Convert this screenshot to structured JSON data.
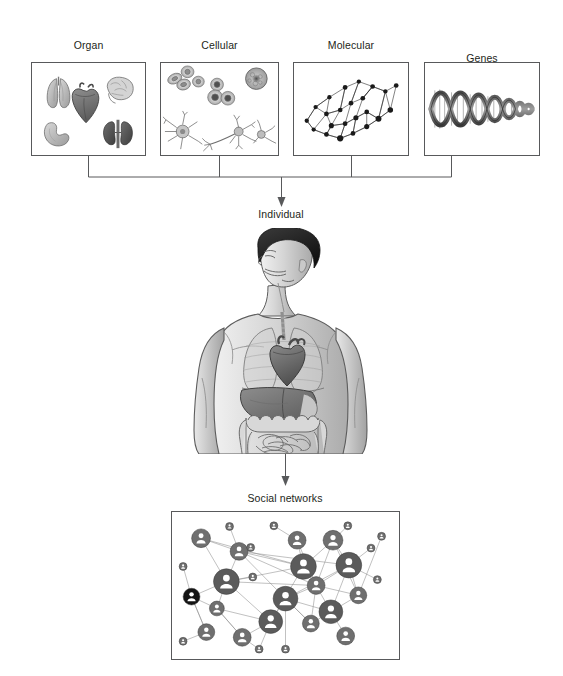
{
  "figure": {
    "width": 563,
    "height": 676,
    "background": "#ffffff",
    "line_color": "#58595b",
    "text_color": "#231f20"
  },
  "panels": [
    {
      "id": "organ-networks",
      "label": "Organ\nnetworks",
      "label_line1": "Organ",
      "label_line2": "networks",
      "icon": "organs-illustration",
      "contents": [
        "lungs",
        "heart",
        "brain",
        "stomach",
        "kidneys"
      ],
      "x": 31,
      "y": 62,
      "w": 115,
      "h": 94
    },
    {
      "id": "cellular-networks",
      "label": "Cellular\nnetworks",
      "label_line1": "Cellular",
      "label_line2": "networks",
      "icon": "cells-illustration",
      "contents": [
        "red blood cells",
        "macrophage",
        "leukocytes",
        "astrocyte",
        "neurons"
      ],
      "x": 160,
      "y": 62,
      "w": 119,
      "h": 94
    },
    {
      "id": "molecular-networks",
      "label": "Molecular\nnetworks",
      "label_line1": "Molecular",
      "label_line2": "networks",
      "icon": "node-link-graph",
      "contents": [
        "interaction network graph"
      ],
      "x": 293,
      "y": 62,
      "w": 116,
      "h": 94
    },
    {
      "id": "genes",
      "label": "Genes",
      "label_line1": "",
      "label_line2": "Genes",
      "icon": "dna-helix",
      "contents": [
        "DNA double helix"
      ],
      "x": 424,
      "y": 62,
      "w": 116,
      "h": 94
    }
  ],
  "stages": {
    "individual": {
      "label": "Individual",
      "icon": "human-torso-anatomy",
      "contents": [
        "head",
        "lungs",
        "heart",
        "liver",
        "stomach",
        "intestines"
      ]
    },
    "social": {
      "label": "Social networks",
      "icon": "social-graph"
    }
  },
  "connectors": {
    "bracket": "four-panel-merge-bracket",
    "arrow_to_individual": "down-arrow",
    "arrow_to_social": "down-arrow"
  },
  "chart_data": {
    "type": "scatter",
    "title": "Social networks",
    "xlabel": "",
    "ylabel": "",
    "node_count": 30,
    "edge_count": 52,
    "nodes": [
      {
        "id": 1,
        "x": 0.1,
        "y": 0.14,
        "r": 9.5,
        "style": "mid"
      },
      {
        "id": 2,
        "x": 0.28,
        "y": 0.24,
        "r": 9.0,
        "style": "mid"
      },
      {
        "id": 3,
        "x": 0.22,
        "y": 0.47,
        "r": 13.0,
        "style": "dark"
      },
      {
        "id": 4,
        "x": 0.055,
        "y": 0.585,
        "r": 8.5,
        "style": "black"
      },
      {
        "id": 5,
        "x": 0.175,
        "y": 0.675,
        "r": 7.5,
        "style": "mid"
      },
      {
        "id": 6,
        "x": 0.125,
        "y": 0.855,
        "r": 8.5,
        "style": "mid"
      },
      {
        "id": 7,
        "x": 0.43,
        "y": 0.775,
        "r": 12.0,
        "style": "dark"
      },
      {
        "id": 8,
        "x": 0.5,
        "y": 0.6,
        "r": 12.5,
        "style": "dark"
      },
      {
        "id": 9,
        "x": 0.645,
        "y": 0.5,
        "r": 9.0,
        "style": "mid"
      },
      {
        "id": 10,
        "x": 0.585,
        "y": 0.355,
        "r": 13.0,
        "style": "dark"
      },
      {
        "id": 11,
        "x": 0.555,
        "y": 0.155,
        "r": 9.0,
        "style": "mid"
      },
      {
        "id": 12,
        "x": 0.725,
        "y": 0.155,
        "r": 10.0,
        "style": "mid"
      },
      {
        "id": 13,
        "x": 0.8,
        "y": 0.345,
        "r": 13.0,
        "style": "dark"
      },
      {
        "id": 14,
        "x": 0.845,
        "y": 0.575,
        "r": 8.5,
        "style": "mid"
      },
      {
        "id": 15,
        "x": 0.715,
        "y": 0.7,
        "r": 12.0,
        "style": "dark"
      },
      {
        "id": 16,
        "x": 0.62,
        "y": 0.79,
        "r": 8.5,
        "style": "mid"
      },
      {
        "id": 17,
        "x": 0.785,
        "y": 0.885,
        "r": 9.0,
        "style": "mid"
      },
      {
        "id": 18,
        "x": 0.295,
        "y": 0.895,
        "r": 9.0,
        "style": "mid"
      },
      {
        "id": 19,
        "x": 0.235,
        "y": 0.05,
        "r": 4.0,
        "style": "small"
      },
      {
        "id": 20,
        "x": 0.445,
        "y": 0.045,
        "r": 4.0,
        "style": "small"
      },
      {
        "id": 21,
        "x": 0.795,
        "y": 0.045,
        "r": 4.0,
        "style": "small"
      },
      {
        "id": 22,
        "x": 0.015,
        "y": 0.355,
        "r": 4.0,
        "style": "small"
      },
      {
        "id": 23,
        "x": 0.345,
        "y": 0.435,
        "r": 4.0,
        "style": "small"
      },
      {
        "id": 24,
        "x": 0.015,
        "y": 0.925,
        "r": 4.0,
        "style": "small"
      },
      {
        "id": 25,
        "x": 0.375,
        "y": 0.985,
        "r": 4.0,
        "style": "small"
      },
      {
        "id": 26,
        "x": 0.5,
        "y": 0.985,
        "r": 4.0,
        "style": "small"
      },
      {
        "id": 27,
        "x": 0.935,
        "y": 0.455,
        "r": 4.0,
        "style": "small"
      },
      {
        "id": 28,
        "x": 0.905,
        "y": 0.215,
        "r": 4.0,
        "style": "small"
      },
      {
        "id": 29,
        "x": 0.955,
        "y": 0.125,
        "r": 4.0,
        "style": "small"
      },
      {
        "id": 30,
        "x": 0.335,
        "y": 0.21,
        "r": 4.0,
        "style": "small"
      }
    ],
    "edges": [
      [
        1,
        2
      ],
      [
        1,
        3
      ],
      [
        1,
        10
      ],
      [
        2,
        19
      ],
      [
        2,
        3
      ],
      [
        2,
        8
      ],
      [
        2,
        13
      ],
      [
        2,
        9
      ],
      [
        3,
        4
      ],
      [
        3,
        5
      ],
      [
        3,
        7
      ],
      [
        3,
        9
      ],
      [
        3,
        10
      ],
      [
        3,
        23
      ],
      [
        4,
        22
      ],
      [
        4,
        6
      ],
      [
        4,
        5
      ],
      [
        5,
        7
      ],
      [
        5,
        18
      ],
      [
        6,
        4
      ],
      [
        7,
        8
      ],
      [
        7,
        18
      ],
      [
        7,
        10
      ],
      [
        7,
        25
      ],
      [
        8,
        9
      ],
      [
        8,
        13
      ],
      [
        8,
        15
      ],
      [
        8,
        16
      ],
      [
        8,
        26
      ],
      [
        9,
        10
      ],
      [
        9,
        13
      ],
      [
        9,
        14
      ],
      [
        9,
        15
      ],
      [
        9,
        16
      ],
      [
        10,
        11
      ],
      [
        10,
        12
      ],
      [
        10,
        2
      ],
      [
        11,
        20
      ],
      [
        11,
        9
      ],
      [
        12,
        13
      ],
      [
        12,
        9
      ],
      [
        12,
        21
      ],
      [
        12,
        14
      ],
      [
        13,
        27
      ],
      [
        13,
        28
      ],
      [
        13,
        14
      ],
      [
        14,
        15
      ],
      [
        14,
        29
      ],
      [
        15,
        17
      ],
      [
        15,
        16
      ],
      [
        15,
        13
      ],
      [
        16,
        8
      ],
      [
        18,
        5
      ],
      [
        18,
        25
      ],
      [
        24,
        6
      ]
    ]
  }
}
